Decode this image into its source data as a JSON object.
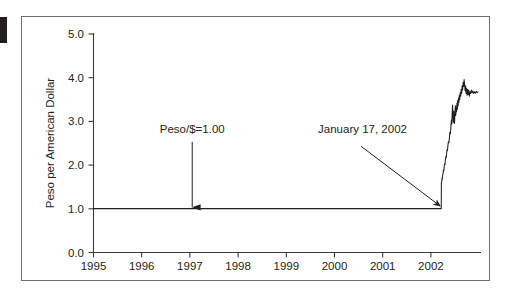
{
  "figure": {
    "background_color": "#ffffff",
    "frame_color": "#6f6f6f",
    "ink_color": "#231f20"
  },
  "chart_data": {
    "type": "line",
    "title": "",
    "subtitle": "",
    "xlabel": "",
    "ylabel": "Peso per American Dollar",
    "xlim": [
      1995.0,
      2002.85
    ],
    "ylim": [
      0.0,
      5.0
    ],
    "grid": false,
    "legend": null,
    "x_tick_labels": [
      "1995",
      "1996",
      "1997",
      "1998",
      "1999",
      "2000",
      "2001",
      "2002"
    ],
    "x_tick_values": [
      1995,
      1996,
      1997,
      1998,
      1999,
      2000,
      2001,
      2002
    ],
    "y_tick_labels": [
      "0.0",
      "1.0",
      "2.0",
      "3.0",
      "4.0",
      "5.0"
    ],
    "y_tick_values": [
      0.0,
      1.0,
      2.0,
      3.0,
      4.0,
      5.0
    ],
    "series": [
      {
        "name": "Peso per American Dollar",
        "color": "#231f20",
        "points": [
          [
            1995.0,
            1.0
          ],
          [
            1996.0,
            1.0
          ],
          [
            1997.0,
            1.0
          ],
          [
            1998.0,
            1.0
          ],
          [
            1999.0,
            1.0
          ],
          [
            2000.0,
            1.0
          ],
          [
            2001.0,
            1.0
          ],
          [
            2001.9,
            1.0
          ],
          [
            2002.045,
            1.0
          ],
          [
            2002.048,
            1.6
          ],
          [
            2002.055,
            1.62
          ],
          [
            2002.062,
            1.7
          ],
          [
            2002.068,
            1.68
          ],
          [
            2002.075,
            1.78
          ],
          [
            2002.082,
            1.8
          ],
          [
            2002.09,
            1.88
          ],
          [
            2002.097,
            1.86
          ],
          [
            2002.105,
            1.95
          ],
          [
            2002.112,
            2.02
          ],
          [
            2002.12,
            2.0
          ],
          [
            2002.128,
            2.1
          ],
          [
            2002.136,
            2.18
          ],
          [
            2002.145,
            2.16
          ],
          [
            2002.153,
            2.26
          ],
          [
            2002.162,
            2.34
          ],
          [
            2002.17,
            2.32
          ],
          [
            2002.18,
            2.44
          ],
          [
            2002.19,
            2.52
          ],
          [
            2002.2,
            2.5
          ],
          [
            2002.21,
            2.62
          ],
          [
            2002.22,
            2.74
          ],
          [
            2002.23,
            2.7
          ],
          [
            2002.24,
            2.86
          ],
          [
            2002.25,
            3.02
          ],
          [
            2002.258,
            2.92
          ],
          [
            2002.266,
            3.18
          ],
          [
            2002.274,
            3.36
          ],
          [
            2002.282,
            3.1
          ],
          [
            2002.29,
            2.96
          ],
          [
            2002.298,
            3.22
          ],
          [
            2002.306,
            3.08
          ],
          [
            2002.314,
            2.94
          ],
          [
            2002.322,
            3.16
          ],
          [
            2002.33,
            3.34
          ],
          [
            2002.338,
            3.12
          ],
          [
            2002.346,
            3.3
          ],
          [
            2002.354,
            3.2
          ],
          [
            2002.362,
            3.4
          ],
          [
            2002.37,
            3.26
          ],
          [
            2002.378,
            3.46
          ],
          [
            2002.386,
            3.34
          ],
          [
            2002.394,
            3.52
          ],
          [
            2002.402,
            3.42
          ],
          [
            2002.41,
            3.58
          ],
          [
            2002.418,
            3.48
          ],
          [
            2002.428,
            3.64
          ],
          [
            2002.438,
            3.56
          ],
          [
            2002.448,
            3.72
          ],
          [
            2002.458,
            3.62
          ],
          [
            2002.468,
            3.8
          ],
          [
            2002.478,
            3.7
          ],
          [
            2002.488,
            3.88
          ],
          [
            2002.498,
            3.78
          ],
          [
            2002.508,
            3.94
          ],
          [
            2002.518,
            3.82
          ],
          [
            2002.528,
            3.68
          ],
          [
            2002.538,
            3.8
          ],
          [
            2002.548,
            3.62
          ],
          [
            2002.558,
            3.74
          ],
          [
            2002.568,
            3.58
          ],
          [
            2002.578,
            3.72
          ],
          [
            2002.59,
            3.6
          ],
          [
            2002.602,
            3.7
          ],
          [
            2002.614,
            3.56
          ],
          [
            2002.626,
            3.66
          ],
          [
            2002.64,
            3.62
          ],
          [
            2002.654,
            3.7
          ],
          [
            2002.668,
            3.64
          ],
          [
            2002.684,
            3.68
          ],
          [
            2002.7,
            3.62
          ],
          [
            2002.716,
            3.66
          ],
          [
            2002.734,
            3.63
          ],
          [
            2002.752,
            3.67
          ],
          [
            2002.77,
            3.64
          ],
          [
            2002.79,
            3.66
          ]
        ]
      }
    ],
    "annotations": [
      {
        "id": "peg-annotation",
        "text": "Peso/$=1.00",
        "label_x": 1997.0,
        "label_y": 2.72,
        "arrow_from": [
          1997.0,
          2.52
        ],
        "arrow_to": [
          1997.0,
          1.03
        ],
        "arrow_style": "vertical-down"
      },
      {
        "id": "devaluation-annotation",
        "text": "January 17, 2002",
        "label_x": 2000.45,
        "label_y": 2.72,
        "arrow_from": [
          2000.42,
          2.42
        ],
        "arrow_to": [
          2002.02,
          1.06
        ],
        "arrow_style": "diagonal-down-right"
      }
    ]
  }
}
